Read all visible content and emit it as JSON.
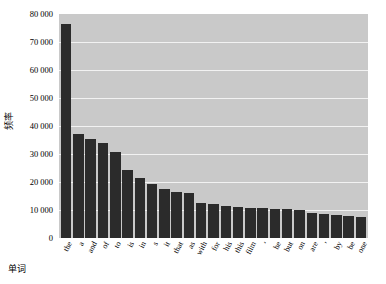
{
  "chart_data": {
    "type": "bar",
    "title": "",
    "xlabel": "单词",
    "ylabel": "频率",
    "categories": [
      "the",
      "a",
      "and",
      "of",
      "to",
      "is",
      "in",
      "s",
      "it",
      "that",
      "as",
      "with",
      "for",
      "his",
      "this",
      "film",
      "‘",
      "he",
      "but",
      "on",
      "are",
      "’",
      "by",
      "be",
      "one"
    ],
    "values": [
      76400,
      37200,
      35200,
      34000,
      30600,
      24400,
      21400,
      19400,
      17600,
      16400,
      16200,
      12400,
      12200,
      11600,
      11200,
      10800,
      10600,
      10400,
      10200,
      10000,
      9000,
      8600,
      8200,
      7800,
      7400
    ],
    "ylim": [
      0,
      80000
    ],
    "yticks": [
      0,
      10000,
      20000,
      30000,
      40000,
      50000,
      60000,
      70000,
      80000
    ],
    "ytick_labels": [
      "0",
      "10 000",
      "20 000",
      "30 000",
      "40 000",
      "50 000",
      "60 000",
      "70 000",
      "80 000"
    ],
    "grid": "horizontal-only",
    "legend": "none",
    "bar_color": "#2b2b2b",
    "plot_background": "#c9c9c9",
    "gridline_color": "#f2f2f2",
    "figure_background": "#ffffff"
  }
}
